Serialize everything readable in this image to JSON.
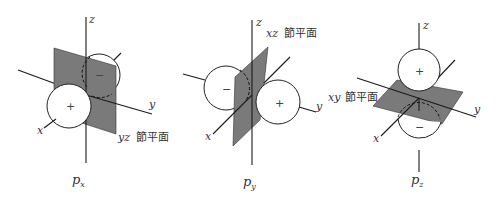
{
  "colors": {
    "plane": "#7a7a7a",
    "line": "#1a1a1a",
    "background": "#ffffff"
  },
  "diagrams": [
    {
      "orbital": {
        "main": "p",
        "sub": "x"
      },
      "axes": {
        "x": "x",
        "y": "y",
        "z": "z"
      },
      "nodal_plane": {
        "axes": "yz",
        "label": "節平面"
      },
      "lobes": {
        "positive": "+",
        "negative": "−"
      }
    },
    {
      "orbital": {
        "main": "p",
        "sub": "y"
      },
      "axes": {
        "x": "x",
        "y": "y",
        "z": "z"
      },
      "nodal_plane": {
        "axes": "xz",
        "label": "節平面"
      },
      "lobes": {
        "positive": "+",
        "negative": "−"
      }
    },
    {
      "orbital": {
        "main": "p",
        "sub": "z"
      },
      "axes": {
        "x": "x",
        "y": "y",
        "z": "z"
      },
      "nodal_plane": {
        "axes": "xy",
        "label": "節平面"
      },
      "lobes": {
        "positive": "+",
        "negative": "−"
      }
    }
  ]
}
